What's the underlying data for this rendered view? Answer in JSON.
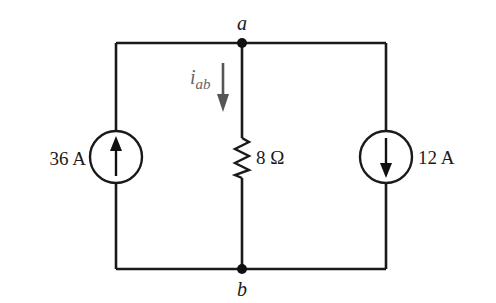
{
  "diagram": {
    "type": "circuit",
    "nodes": {
      "top": {
        "label": "a"
      },
      "bottom": {
        "label": "b"
      }
    },
    "components": {
      "left_source": {
        "type": "current-source",
        "value": "36 A",
        "direction": "up"
      },
      "resistor": {
        "type": "resistor",
        "value": "8 Ω"
      },
      "right_source": {
        "type": "current-source",
        "value": "12 A",
        "direction": "down"
      }
    },
    "current_label": {
      "main": "i",
      "subscript": "ab",
      "direction": "down"
    },
    "colors": {
      "wire": "#1a1a1a",
      "current_arrow": "#555555",
      "background": "#ffffff"
    }
  }
}
